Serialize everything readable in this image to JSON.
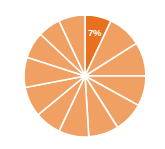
{
  "chart_data": {
    "type": "pie",
    "title": "",
    "subtitle": "",
    "xlabel": "",
    "ylabel": "",
    "legend": "none",
    "grid": false,
    "center": {
      "x": 85,
      "y": 76
    },
    "radius": 61,
    "start_angle_deg": -90,
    "separator_color": "#ffffff",
    "separator_width": 1.6,
    "background": "#ffffff",
    "base_color": "#F0A063",
    "highlight_color": "#E8701E",
    "label_color": "#ffffff",
    "categories": [
      "Slice 1",
      "Slice 2",
      "Slice 3",
      "Slice 4",
      "Slice 5",
      "Slice 6",
      "Slice 7",
      "Slice 8",
      "Slice 9",
      "Slice 10",
      "Slice 11",
      "Slice 12",
      "Slice 13"
    ],
    "values": [
      7,
      9,
      9,
      8,
      8,
      8,
      8,
      7,
      8,
      8,
      7,
      6,
      7
    ],
    "colors": [
      "#E8701E",
      "#F0A063",
      "#F0A063",
      "#F0A063",
      "#F0A063",
      "#F0A063",
      "#F0A063",
      "#F0A063",
      "#F0A063",
      "#F0A063",
      "#F0A063",
      "#F0A063",
      "#F0A063"
    ],
    "data_labels": [
      "7%",
      "",
      "",
      "",
      "",
      "",
      "",
      "",
      "",
      "",
      "",
      "",
      ""
    ],
    "highlighted_index": 0,
    "highlighted_label": "7%"
  }
}
